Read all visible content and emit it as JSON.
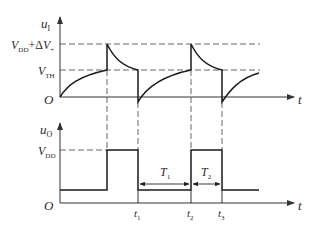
{
  "diagram": {
    "top_plot": {
      "y_label": "u",
      "y_label_sub": "I",
      "x_label": "t",
      "origin_label": "O",
      "level_high_label": {
        "v": "V",
        "sub": "DD",
        "plus": "+Δ",
        "v2": "V",
        "sub2": "+"
      },
      "level_th_label": {
        "v": "V",
        "sub": "TH"
      }
    },
    "bottom_plot": {
      "y_label": "u",
      "y_label_sub": "O",
      "x_label": "t",
      "origin_label": "O",
      "level_label": {
        "v": "V",
        "sub": "DD"
      },
      "ticks": [
        {
          "t": "t",
          "sub": "1"
        },
        {
          "t": "t",
          "sub": "2"
        },
        {
          "t": "t",
          "sub": "3"
        }
      ],
      "intervals": [
        {
          "t": "T",
          "sub": "1"
        },
        {
          "t": "T",
          "sub": "2"
        }
      ]
    },
    "colors": {
      "line": "#1a1a1a",
      "dash": "#555555",
      "text": "#2a2a2a"
    }
  }
}
